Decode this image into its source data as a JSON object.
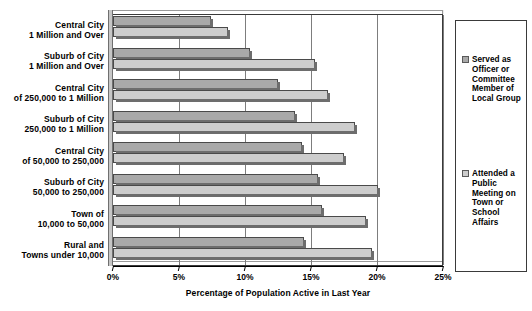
{
  "chart_data": {
    "type": "bar",
    "orientation": "horizontal",
    "title": "",
    "xlabel": "Percentage of Population Active in Last Year",
    "ylabel": "",
    "xlim": [
      0,
      25
    ],
    "xticks": [
      0,
      5,
      10,
      15,
      20,
      25
    ],
    "xtick_labels": [
      "0%",
      "5%",
      "10%",
      "15%",
      "20%",
      "25%"
    ],
    "grid": "vertical",
    "legend_position": "right",
    "categories": [
      [
        "Central City",
        "1 Million and Over"
      ],
      [
        "Suburb of City",
        "1 Million and Over"
      ],
      [
        "Central City",
        "of 250,000 to 1 Million"
      ],
      [
        "Suburb of City",
        "250,000 to 1 Million"
      ],
      [
        "Central City",
        "of 50,000 to 250,000"
      ],
      [
        "Suburb of City",
        "50,000 to 250,000"
      ],
      [
        "Town of",
        "10,000 to 50,000"
      ],
      [
        "Rural and",
        "Towns under 10,000"
      ]
    ],
    "series": [
      {
        "name": "Served as Officer or Committee Member of Local Group",
        "color": "#a9a9a9",
        "values": [
          7.4,
          10.4,
          12.5,
          13.8,
          14.3,
          15.5,
          15.8,
          14.5
        ]
      },
      {
        "name": "Attended a Public Meeting on Town or School Affairs",
        "color": "#cdcdcd",
        "values": [
          8.7,
          15.3,
          16.3,
          18.3,
          17.5,
          20.1,
          19.2,
          19.6
        ]
      }
    ]
  },
  "legend": {
    "entries": [
      {
        "label": "Served as Officer or Committee Member of Local Group",
        "color": "#a9a9a9"
      },
      {
        "label": "Attended a Public Meeting on Town or School Affairs",
        "color": "#cdcdcd"
      }
    ]
  }
}
